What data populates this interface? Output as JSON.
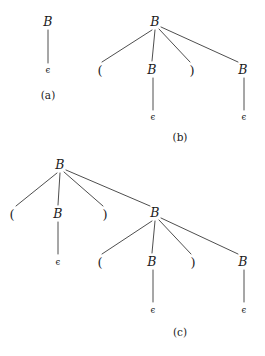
{
  "figure": {
    "background_color": "#ffffff",
    "ink_color": "#1b1b1b",
    "edge_color": "#3a3a3a"
  },
  "symbols": {
    "nonterminal": "B",
    "empty_string": "ϵ",
    "left_paren": "(",
    "right_paren": ")"
  },
  "subfigures": [
    {
      "id": "a",
      "caption": "(a)",
      "caption_x": 48,
      "caption_y": 95,
      "nodes": [
        {
          "name": "a-root-B",
          "label": "B",
          "kind": "B",
          "x": 48,
          "y": 22
        },
        {
          "name": "a-eps",
          "label": "ϵ",
          "kind": "eps",
          "x": 48,
          "y": 70
        }
      ],
      "edges": [
        {
          "x1": 48,
          "y1": 30,
          "x2": 48,
          "y2": 63
        }
      ]
    },
    {
      "id": "b",
      "caption": "(b)",
      "caption_x": 180,
      "caption_y": 137,
      "nodes": [
        {
          "name": "b-root-B",
          "label": "B",
          "kind": "B",
          "x": 155,
          "y": 22
        },
        {
          "name": "b-left-paren",
          "label": "(",
          "kind": "paren",
          "x": 100,
          "y": 70
        },
        {
          "name": "b-inner-B",
          "label": "B",
          "kind": "B",
          "x": 152,
          "y": 70
        },
        {
          "name": "b-right-paren",
          "label": ")",
          "kind": "paren",
          "x": 192,
          "y": 70
        },
        {
          "name": "b-tail-B",
          "label": "B",
          "kind": "B",
          "x": 243,
          "y": 70
        },
        {
          "name": "b-inner-eps",
          "label": "ϵ",
          "kind": "eps",
          "x": 153,
          "y": 117
        },
        {
          "name": "b-tail-eps",
          "label": "ϵ",
          "kind": "eps",
          "x": 244,
          "y": 117
        }
      ],
      "edges": [
        {
          "x1": 152,
          "y1": 30,
          "x2": 102,
          "y2": 62
        },
        {
          "x1": 155,
          "y1": 30,
          "x2": 152,
          "y2": 61
        },
        {
          "x1": 159,
          "y1": 29,
          "x2": 190,
          "y2": 62
        },
        {
          "x1": 161,
          "y1": 27,
          "x2": 238,
          "y2": 62
        },
        {
          "x1": 153,
          "y1": 78,
          "x2": 153,
          "y2": 110
        },
        {
          "x1": 244,
          "y1": 78,
          "x2": 244,
          "y2": 110
        }
      ]
    },
    {
      "id": "c",
      "caption": "(c)",
      "caption_x": 180,
      "caption_y": 332,
      "nodes": [
        {
          "name": "c-root-B",
          "label": "B",
          "kind": "B",
          "x": 60,
          "y": 165
        },
        {
          "name": "c-left-paren",
          "label": "(",
          "kind": "paren",
          "x": 12,
          "y": 214
        },
        {
          "name": "c-inner-B",
          "label": "B",
          "kind": "B",
          "x": 58,
          "y": 214
        },
        {
          "name": "c-right-paren",
          "label": ")",
          "kind": "paren",
          "x": 105,
          "y": 214
        },
        {
          "name": "c-tail-B",
          "label": "B",
          "kind": "B",
          "x": 155,
          "y": 213
        },
        {
          "name": "c-inner-eps",
          "label": "ϵ",
          "kind": "eps",
          "x": 58,
          "y": 262
        },
        {
          "name": "c-t-left-paren",
          "label": "(",
          "kind": "paren",
          "x": 100,
          "y": 262
        },
        {
          "name": "c-t-inner-B",
          "label": "B",
          "kind": "B",
          "x": 152,
          "y": 262
        },
        {
          "name": "c-t-right-paren",
          "label": ")",
          "kind": "paren",
          "x": 193,
          "y": 262
        },
        {
          "name": "c-t-tail-B",
          "label": "B",
          "kind": "B",
          "x": 243,
          "y": 262
        },
        {
          "name": "c-t-inner-eps",
          "label": "ϵ",
          "kind": "eps",
          "x": 153,
          "y": 310
        },
        {
          "name": "c-t-tail-eps",
          "label": "ϵ",
          "kind": "eps",
          "x": 244,
          "y": 310
        }
      ],
      "edges": [
        {
          "x1": 57,
          "y1": 173,
          "x2": 16,
          "y2": 206
        },
        {
          "x1": 60,
          "y1": 173,
          "x2": 58,
          "y2": 205
        },
        {
          "x1": 64,
          "y1": 172,
          "x2": 103,
          "y2": 206
        },
        {
          "x1": 66,
          "y1": 170,
          "x2": 150,
          "y2": 206
        },
        {
          "x1": 58,
          "y1": 222,
          "x2": 58,
          "y2": 254
        },
        {
          "x1": 152,
          "y1": 221,
          "x2": 102,
          "y2": 254
        },
        {
          "x1": 155,
          "y1": 221,
          "x2": 152,
          "y2": 253
        },
        {
          "x1": 159,
          "y1": 220,
          "x2": 191,
          "y2": 254
        },
        {
          "x1": 161,
          "y1": 218,
          "x2": 238,
          "y2": 254
        },
        {
          "x1": 153,
          "y1": 270,
          "x2": 153,
          "y2": 302
        },
        {
          "x1": 244,
          "y1": 270,
          "x2": 244,
          "y2": 302
        }
      ]
    }
  ]
}
